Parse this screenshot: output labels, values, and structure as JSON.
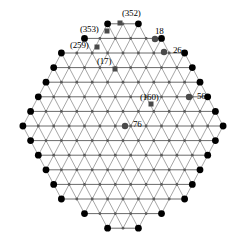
{
  "figure": {
    "width": 246,
    "height": 252,
    "background": "#ffffff"
  },
  "style": {
    "edge_color": "#888888",
    "edge_color_strong": "#6b6b6b",
    "interior_vertex_color": "#5a5a5a",
    "boundary_vertex_color": "#000000",
    "highlight_marker_color": "#4a4a4a",
    "label_color": "#000000"
  },
  "chart_data": {
    "type": "scatter",
    "title": "",
    "xlabel": "",
    "ylabel": "",
    "grid": false,
    "legend": "none",
    "lattice": {
      "rows": 15,
      "dx": 15.4,
      "dy": 14.6,
      "origin_x": 123,
      "origin_y": 126,
      "row_counts": [
        3,
        6,
        9,
        10,
        11,
        12,
        13,
        14,
        13,
        12,
        11,
        10,
        9,
        6,
        3
      ]
    },
    "labeled_points": [
      {
        "id": "p352",
        "label": "(352)",
        "marker": "square",
        "x": 120,
        "y": 23,
        "label_x": 122,
        "label_y": 9,
        "value": 352,
        "parenthesized": true
      },
      {
        "id": "p353",
        "label": "(353)",
        "marker": "square",
        "x": 107,
        "y": 31,
        "label_x": 80,
        "label_y": 25,
        "value": 353,
        "parenthesized": true
      },
      {
        "id": "p18",
        "label": "18",
        "marker": "circle",
        "x": 155,
        "y": 39,
        "label_x": 155,
        "label_y": 27,
        "value": 18,
        "parenthesized": false
      },
      {
        "id": "p259",
        "label": "(259)",
        "marker": "square",
        "x": 97,
        "y": 47,
        "label_x": 70,
        "label_y": 41,
        "value": 259,
        "parenthesized": true
      },
      {
        "id": "p26",
        "label": "26",
        "marker": "circle",
        "x": 164,
        "y": 52,
        "label_x": 173,
        "label_y": 46,
        "value": 26,
        "parenthesized": false
      },
      {
        "id": "p17",
        "label": "(17)",
        "marker": "square",
        "x": 115,
        "y": 69,
        "label_x": 97,
        "label_y": 57,
        "value": 17,
        "parenthesized": true
      },
      {
        "id": "p56",
        "label": "56",
        "marker": "circle",
        "x": 189,
        "y": 97,
        "label_x": 197,
        "label_y": 92,
        "value": 56,
        "parenthesized": false
      },
      {
        "id": "p160",
        "label": "(160)",
        "marker": "square",
        "x": 151,
        "y": 104,
        "label_x": 140,
        "label_y": 93,
        "value": 160,
        "parenthesized": true
      },
      {
        "id": "p76",
        "label": "76",
        "marker": "circle",
        "x": 125,
        "y": 126,
        "label_x": 133,
        "label_y": 120,
        "value": 76,
        "parenthesized": false
      }
    ],
    "labels": [
      "(352)",
      "(353)",
      "18",
      "(259)",
      "26",
      "(17)",
      "56",
      "(160)",
      "76"
    ],
    "values": [
      352,
      353,
      18,
      259,
      26,
      17,
      56,
      160,
      76
    ]
  }
}
